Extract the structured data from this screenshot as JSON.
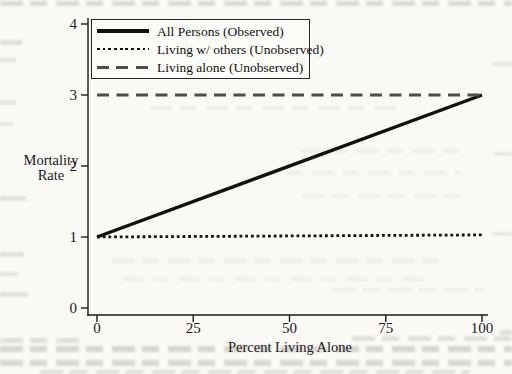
{
  "page": {
    "background_color": "#faf9f6",
    "ink_color": "#1a1a1a"
  },
  "chart_data": {
    "type": "line",
    "title": "",
    "xlabel": "Percent Living Alone",
    "ylabel": "Mortality Rate",
    "ylabel_lines": [
      "Mortality",
      "Rate"
    ],
    "xlim": [
      0,
      100
    ],
    "ylim": [
      0,
      4
    ],
    "x_ticks": [
      0,
      25,
      50,
      75,
      100
    ],
    "y_ticks": [
      0,
      1,
      2,
      3,
      4
    ],
    "grid": false,
    "legend_position": "top-left",
    "series": [
      {
        "name": "All Persons (Observed)",
        "line_style": "solid",
        "color": "#111111",
        "points": [
          [
            0,
            1
          ],
          [
            100,
            3
          ]
        ]
      },
      {
        "name": "Living w/ others (Unobserved)",
        "line_style": "dotted",
        "color": "#111111",
        "points": [
          [
            0,
            1
          ],
          [
            100,
            1.03
          ]
        ]
      },
      {
        "name": "Living alone (Unobserved)",
        "line_style": "dashed",
        "color": "#4d4d4d",
        "points": [
          [
            0,
            3
          ],
          [
            100,
            3
          ]
        ]
      }
    ]
  }
}
